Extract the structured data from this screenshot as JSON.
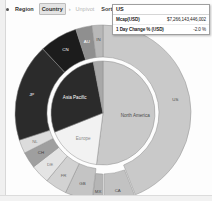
{
  "toolbar": {
    "drag_handle_icon": "drag-dot-icon",
    "breadcrumb": [
      {
        "label": "Region",
        "state": "link"
      },
      {
        "label": "›",
        "state": "separator"
      },
      {
        "label": "Country",
        "state": "active"
      }
    ],
    "buttons": [
      {
        "label": "Unpivot",
        "enabled": false
      },
      {
        "label": "Sort",
        "enabled": true
      },
      {
        "label": "Pivot",
        "enabled": true
      }
    ]
  },
  "tooltip": {
    "title": "US",
    "rows": [
      {
        "label": "Mcap(USD)",
        "value": "$7,266,143,446,002"
      },
      {
        "label": "1 Day Change % (USD)",
        "value": "-2.0 %"
      }
    ]
  },
  "chart_data": {
    "type": "pie",
    "title": "",
    "subtitle": "",
    "variant": "sunburst-nested-donut",
    "value_label": "Mcap(USD)",
    "legend_position": "none",
    "grid": false,
    "rings": [
      {
        "name": "Region",
        "level": 0,
        "inner_radius_px": 0,
        "outer_radius_px": 52,
        "slices": [
          {
            "label": "North America",
            "value": 52.0,
            "color": "#c9c9c9",
            "text_color": "#4a4a4a",
            "exploded": false
          },
          {
            "label": "Europe",
            "value": 17.0,
            "color": "#f2f2f2",
            "text_color": "#8a8a8a",
            "exploded": false
          },
          {
            "label": "Asia Pacific",
            "value": 28.0,
            "color": "#2b2b2b",
            "text_color": "#ffffff",
            "exploded": false
          },
          {
            "label": "",
            "value": 3.0,
            "color": "#a8a8a8",
            "text_color": "#4a4a4a",
            "exploded": false
          }
        ]
      },
      {
        "name": "Country",
        "level": 1,
        "inner_radius_px": 56,
        "outer_radius_px": 88,
        "slices": [
          {
            "label": "US",
            "value": 44.0,
            "color": "#c9c9c9",
            "text_color": "#4a4a4a",
            "exploded": false
          },
          {
            "label": "CA",
            "value": 6.0,
            "color": "#c2c2c2",
            "text_color": "#4a4a4a",
            "exploded": true
          },
          {
            "label": "MX",
            "value": 2.0,
            "color": "#b5b5b5",
            "text_color": "#4a4a4a",
            "exploded": true
          },
          {
            "label": "GB",
            "value": 5.0,
            "color": "#c4c4c4",
            "text_color": "#4a4a4a",
            "exploded": false
          },
          {
            "label": "FR",
            "value": 4.0,
            "color": "#d2d2d2",
            "text_color": "#6a6a6a",
            "exploded": false
          },
          {
            "label": "DE",
            "value": 3.5,
            "color": "#e4e4e4",
            "text_color": "#7a7a7a",
            "exploded": false
          },
          {
            "label": "CH",
            "value": 3.0,
            "color": "#9f9f9f",
            "text_color": "#3a3a3a",
            "exploded": false
          },
          {
            "label": "NL",
            "value": 2.5,
            "color": "#dcdcdc",
            "text_color": "#7a7a7a",
            "exploded": false
          },
          {
            "label": "JP",
            "value": 18.0,
            "color": "#2b2b2b",
            "text_color": "#ffffff",
            "exploded": false
          },
          {
            "label": "CN",
            "value": 7.0,
            "color": "#1c1c1c",
            "text_color": "#ffffff",
            "exploded": false
          },
          {
            "label": "AU",
            "value": 3.0,
            "color": "#8f8f8f",
            "text_color": "#ffffff",
            "exploded": false
          },
          {
            "label": "IN",
            "value": 2.0,
            "color": "#b8b8b8",
            "text_color": "#4a4a4a",
            "exploded": false
          }
        ]
      }
    ],
    "colors": {
      "north_america": "#c9c9c9",
      "europe": "#f2f2f2",
      "asia_pacific": "#2b2b2b",
      "background": "#ffffff",
      "stroke": "#8e8e8e"
    }
  }
}
